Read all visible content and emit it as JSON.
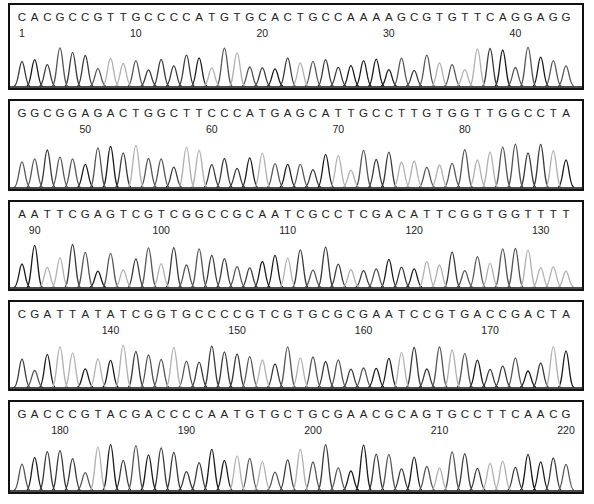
{
  "chart_data": {
    "type": "line",
    "title": "",
    "grid": false,
    "legend": null,
    "rows": [
      {
        "sequence": "CACGCCGTTGCCCCATGTGCACTGCCAAAAGCGTGTTCAGGAGG",
        "start": 1,
        "ticks": [
          1,
          10,
          20,
          30,
          40
        ]
      },
      {
        "sequence": "GGCGGAGACTGGCTTCCCATGAGCATTGCCTTGTGGTTGGCCTA",
        "start": 45,
        "ticks": [
          50,
          60,
          70,
          80
        ]
      },
      {
        "sequence": "AATTCGAGTCGTCGGCCGCAATCGCCTCGACATTCGGTGGTTTT",
        "start": 89,
        "ticks": [
          90,
          100,
          110,
          120,
          130
        ]
      },
      {
        "sequence": "CGATTATATCGGTGCCCCGTCGTGCGCGAATCCGTGACCGACTA",
        "start": 133,
        "ticks": [
          140,
          150,
          160,
          170
        ]
      },
      {
        "sequence": "GACCCGTACGACCCCAATGTGCTGCGAACGCAGTGCCTTCAACG",
        "start": 177,
        "ticks": [
          180,
          190,
          200,
          210,
          220
        ]
      }
    ],
    "base_colors": {
      "A": "#1a1a1a",
      "C": "#3a3a3a",
      "G": "#555555",
      "T": "#b0b0b0"
    },
    "xlabel": "",
    "ylabel": ""
  },
  "panels": [
    {
      "top": 3,
      "height": 87
    },
    {
      "top": 99,
      "height": 92
    },
    {
      "top": 200,
      "height": 91
    },
    {
      "top": 300,
      "height": 91
    },
    {
      "top": 400,
      "height": 94
    }
  ]
}
